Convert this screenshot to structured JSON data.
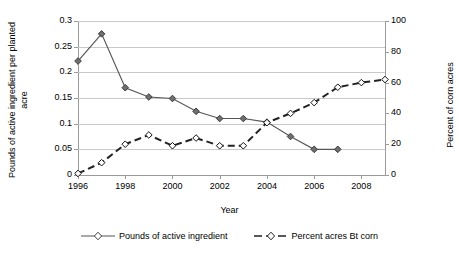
{
  "chart_data": {
    "type": "line",
    "title": "",
    "xlabel": "Year",
    "ylabel": "Pounds of active ingredient per planted acre",
    "y2label": "Percent of corn acres",
    "grid": true,
    "legend_position": "bottom",
    "xlim": [
      1996,
      2009
    ],
    "ylim": [
      0,
      0.3
    ],
    "y2lim": [
      0,
      100
    ],
    "x": [
      1996,
      1997,
      1998,
      1999,
      2000,
      2001,
      2002,
      2003,
      2004,
      2005,
      2006,
      2007
    ],
    "categories": [
      "1996",
      "1997",
      "1998",
      "1999",
      "2000",
      "2001",
      "2002",
      "2003",
      "2004",
      "2005",
      "2006",
      "2007",
      "2008",
      "2009"
    ],
    "xticks": [
      "1996",
      "1998",
      "2000",
      "2002",
      "2004",
      "2006",
      "2008"
    ],
    "xtick_values": [
      1996,
      1998,
      2000,
      2002,
      2004,
      2006,
      2008
    ],
    "yticks": [
      "0",
      "0.05",
      "0.1",
      "0.15",
      "0.2",
      "0.25",
      "0.3"
    ],
    "ytick_values": [
      0,
      0.05,
      0.1,
      0.15,
      0.2,
      0.25,
      0.3
    ],
    "y2ticks": [
      "0",
      "20",
      "40",
      "60",
      "80",
      "100"
    ],
    "y2tick_values": [
      0,
      20,
      40,
      60,
      80,
      100
    ],
    "series": [
      {
        "name": "Pounds of active ingredient",
        "axis": "left",
        "line_style": "solid",
        "marker": "diamond-filled",
        "color": "#555555",
        "x": [
          1996,
          1997,
          1998,
          1999,
          2000,
          2001,
          2002,
          2003,
          2004,
          2005,
          2006,
          2007
        ],
        "values": [
          0.222,
          0.275,
          0.17,
          0.152,
          0.149,
          0.124,
          0.11,
          0.11,
          0.103,
          0.075,
          0.05,
          0.05
        ]
      },
      {
        "name": "Percent acres Bt corn",
        "axis": "right",
        "line_style": "dashed",
        "marker": "diamond-open",
        "color": "#222222",
        "x": [
          1996,
          1997,
          1998,
          1999,
          2000,
          2001,
          2002,
          2003,
          2004,
          2005,
          2006,
          2007,
          2008,
          2009
        ],
        "values": [
          1,
          8,
          20,
          26,
          19,
          24,
          19,
          19,
          34,
          40,
          47,
          57,
          60,
          62
        ]
      }
    ]
  },
  "legend": {
    "items": [
      {
        "label": "Pounds of active ingredient",
        "style": "solid"
      },
      {
        "label": "Percent acres Bt corn",
        "style": "dashed"
      }
    ]
  }
}
